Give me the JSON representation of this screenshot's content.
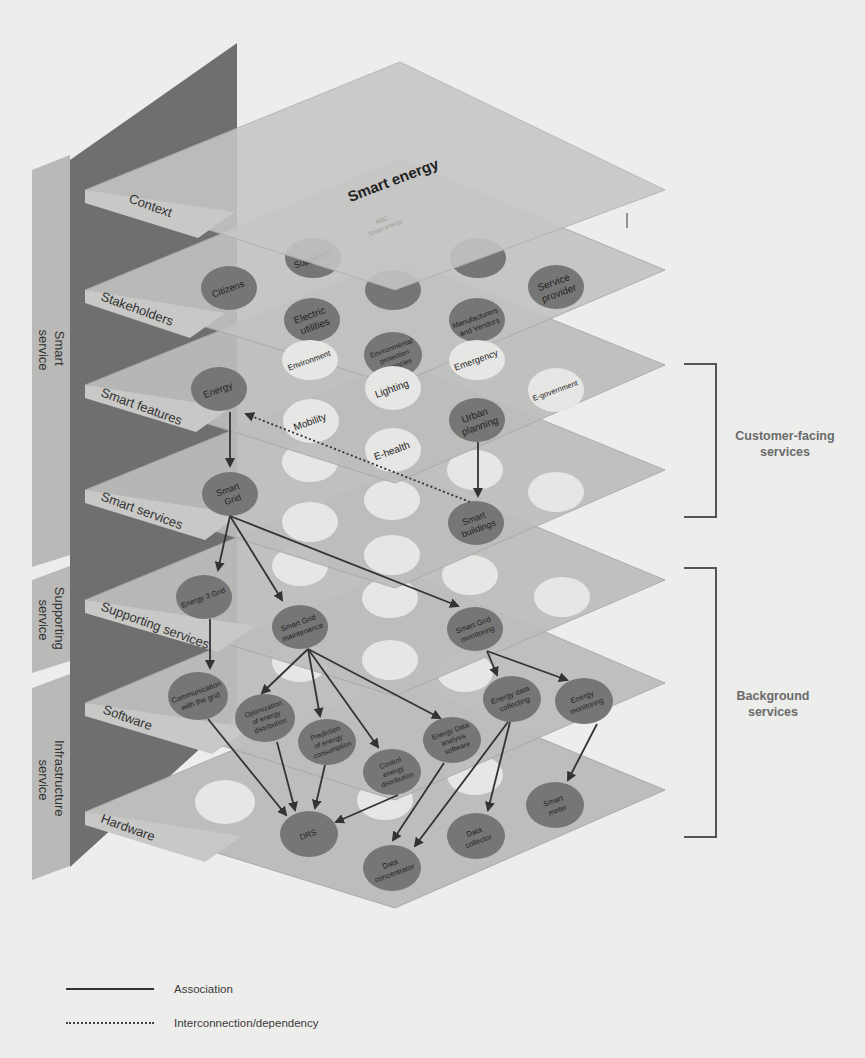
{
  "diagram": {
    "title": "Smart energy",
    "hidden_context_labels": [
      "ABC",
      "Smart energy"
    ],
    "side_groups": [
      {
        "id": "smart",
        "label_lines": [
          "Smart",
          "service"
        ]
      },
      {
        "id": "supporting",
        "label_lines": [
          "Supporting",
          "service"
        ]
      },
      {
        "id": "infrastructure",
        "label_lines": [
          "Infrastructure",
          "service"
        ]
      }
    ],
    "layers": [
      {
        "id": "context",
        "label": "Context"
      },
      {
        "id": "stakeholders",
        "label": "Stakeholders"
      },
      {
        "id": "smart_features",
        "label": "Smart features"
      },
      {
        "id": "smart_services",
        "label": "Smart services"
      },
      {
        "id": "supporting_services",
        "label": "Supporting services"
      },
      {
        "id": "software",
        "label": "Software"
      },
      {
        "id": "hardware",
        "label": "Hardware"
      }
    ],
    "nodes": {
      "citizens": {
        "lines": [
          "Citizens"
        ]
      },
      "suppliers": {
        "lines": [
          "Suppliers"
        ]
      },
      "electric_utilities": {
        "lines": [
          "Electric",
          "utilities"
        ]
      },
      "env_agencies": {
        "lines": [
          "Environmental",
          "protection",
          "agencies"
        ]
      },
      "manufacturers": {
        "lines": [
          "Manufacturers",
          "and Vendors"
        ]
      },
      "service_provider": {
        "lines": [
          "Service",
          "provider"
        ]
      },
      "environment": {
        "lines": [
          "Environment"
        ]
      },
      "emergency": {
        "lines": [
          "Emergency"
        ]
      },
      "energy": {
        "lines": [
          "Energy"
        ]
      },
      "mobility": {
        "lines": [
          "Mobility"
        ]
      },
      "lighting": {
        "lines": [
          "Lighting"
        ]
      },
      "e_health": {
        "lines": [
          "E-health"
        ]
      },
      "urban_planning": {
        "lines": [
          "Urban",
          "planning"
        ]
      },
      "e_government": {
        "lines": [
          "E-government"
        ]
      },
      "smart_grid": {
        "lines": [
          "Smart",
          "Grid"
        ]
      },
      "smart_buildings": {
        "lines": [
          "Smart",
          "buildings"
        ]
      },
      "energy_3_grid": {
        "lines": [
          "Energy 3 Grid"
        ]
      },
      "sg_maintenance": {
        "lines": [
          "Smart Grid",
          "maintenance"
        ]
      },
      "sg_monitoring": {
        "lines": [
          "Smart Grid",
          "monitoring"
        ]
      },
      "comm_grid": {
        "lines": [
          "Communication",
          "with the grid"
        ]
      },
      "opt_energy": {
        "lines": [
          "Optimization",
          "of energy",
          "distribution"
        ]
      },
      "pred_energy": {
        "lines": [
          "Prediction",
          "of energy",
          "consumption"
        ]
      },
      "control_energy": {
        "lines": [
          "Control",
          "energy",
          "distribution"
        ]
      },
      "energy_data_sw": {
        "lines": [
          "Energy Data",
          "analysis",
          "software"
        ]
      },
      "energy_data_collecting": {
        "lines": [
          "Energy data",
          "collecting"
        ]
      },
      "energy_monitoring": {
        "lines": [
          "Energy",
          "monitoring"
        ]
      },
      "drs": {
        "lines": [
          "DRS"
        ]
      },
      "data_concentrator": {
        "lines": [
          "Data",
          "concentrator"
        ]
      },
      "data_collector": {
        "lines": [
          "Data",
          "collector"
        ]
      },
      "smart_meter": {
        "lines": [
          "Smart",
          "meter"
        ]
      }
    },
    "brackets": [
      {
        "id": "customer",
        "label_lines": [
          "Customer-facing",
          "services"
        ]
      },
      {
        "id": "background",
        "label_lines": [
          "Background",
          "services"
        ]
      }
    ],
    "legend": [
      {
        "style": "solid",
        "label": "Association"
      },
      {
        "style": "dotted",
        "label": "Interconnection/dependency"
      }
    ],
    "colors": {
      "background": "#ededeb",
      "back_wall": "#6f6f6f",
      "side_band": "#b9b9b7",
      "plane": "#bdbdbb",
      "plane_edge": "#a9a9a7",
      "node_dark": "#767676",
      "node_light": "#e6e6e4",
      "arrow": "#333333"
    }
  }
}
